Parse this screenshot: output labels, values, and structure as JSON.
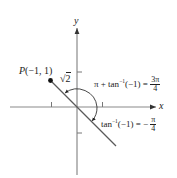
{
  "diagram": {
    "axes": {
      "x_label": "x",
      "y_label": "y"
    },
    "point": {
      "label": "P(−1, 1)",
      "letter": "P",
      "coords": "(−1, 1)"
    },
    "radius_label": {
      "radical": "√",
      "value": "2"
    },
    "angle_large": {
      "lhs": "π + tan",
      "exp": "−1",
      "arg": "(−1) =",
      "num": "3π",
      "den": "4"
    },
    "angle_small": {
      "lhs": "tan",
      "exp": "−1",
      "arg": "(−1) = −",
      "num": "π",
      "den": "4"
    },
    "colors": {
      "axis": "#888888",
      "line": "#555555",
      "text": "#222222"
    }
  }
}
